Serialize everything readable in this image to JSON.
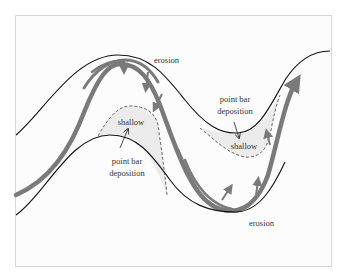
{
  "diagram": {
    "type": "meandering-river",
    "colors": {
      "background": "#ffffff",
      "frame_fill": "#fcfcfc",
      "frame_border": "#d6d6d6",
      "bank_line": "#111111",
      "flow_arrow": "#7a7a7a",
      "shallow_fill": "#ebebeb",
      "dashed_line": "#555555",
      "label_text": "#333333"
    },
    "labels": {
      "erosion_top": "erosion",
      "erosion_bottom": "erosion",
      "point_bar_left_line1": "point bar",
      "point_bar_left_line2": "deposition",
      "point_bar_right_line1": "point bar",
      "point_bar_right_line2": "deposition",
      "shallow_left": "shallow",
      "shallow_right": "shallow"
    },
    "elements": [
      {
        "name": "upper-bank",
        "kind": "river bank line"
      },
      {
        "name": "lower-bank",
        "kind": "river bank line"
      },
      {
        "name": "main-flow-arrow",
        "kind": "thalweg / main current arrow"
      },
      {
        "name": "secondary-flow-arrows",
        "kind": "outer-bend current arrows"
      },
      {
        "name": "left-point-bar",
        "kind": "shallow deposition zone (dashed)"
      },
      {
        "name": "right-point-bar",
        "kind": "shallow deposition zone (dashed)"
      }
    ]
  }
}
